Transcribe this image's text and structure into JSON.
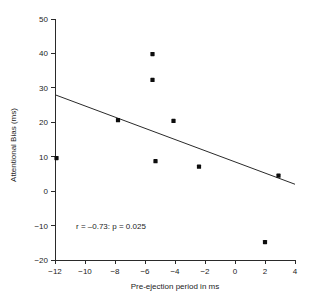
{
  "chart_data": {
    "type": "scatter",
    "title": "",
    "xlabel": "Pre-ejection period in ms",
    "ylabel": "Attentional Bias (ms)",
    "xlim": [
      -12,
      4
    ],
    "ylim": [
      -20,
      50
    ],
    "xticks": [
      -12,
      -10,
      -8,
      -6,
      -4,
      -2,
      0,
      2,
      4
    ],
    "xtick_labels": [
      "−12",
      "−10",
      "−8",
      "−6",
      "−4",
      "−2",
      "0",
      "2",
      "4"
    ],
    "yticks": [
      -20,
      -10,
      0,
      10,
      20,
      30,
      40,
      50
    ],
    "ytick_labels": [
      "−20",
      "−10",
      "0",
      "10",
      "20",
      "30",
      "40",
      "50"
    ],
    "grid": false,
    "legend": null,
    "points": [
      {
        "x": -11.9,
        "y": 9.6
      },
      {
        "x": -7.8,
        "y": 20.6
      },
      {
        "x": -5.5,
        "y": 39.8
      },
      {
        "x": -5.5,
        "y": 32.3
      },
      {
        "x": -5.3,
        "y": 8.7
      },
      {
        "x": -4.1,
        "y": 20.4
      },
      {
        "x": -2.4,
        "y": 7.1
      },
      {
        "x": 2.0,
        "y": -14.8
      },
      {
        "x": 2.9,
        "y": 4.5
      }
    ],
    "fit_line": {
      "x1": -12,
      "y1": 28.0,
      "x2": 4,
      "y2": 2.0
    },
    "annotations": [
      {
        "text": "r = –0.73: p = 0.025",
        "x": -10.6,
        "y": -10.0
      }
    ],
    "marker_color": "#0d0d0d",
    "line_color": "#2a2a2a",
    "axis_color": "#2a2a2a",
    "background_color": "#ffffff"
  }
}
